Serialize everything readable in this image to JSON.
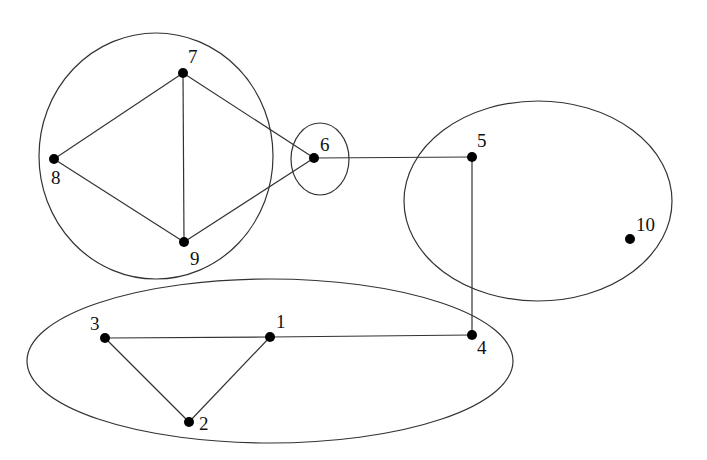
{
  "diagram": {
    "type": "graph",
    "clusters": [
      {
        "id": "A",
        "members": [
          "7",
          "8",
          "9"
        ],
        "shape": "circle",
        "cx": 156,
        "cy": 156,
        "rx": 117,
        "ry": 123
      },
      {
        "id": "B",
        "members": [
          "6"
        ],
        "shape": "ellipse",
        "cx": 320,
        "cy": 159,
        "rx": 29,
        "ry": 36
      },
      {
        "id": "C",
        "members": [
          "5",
          "10"
        ],
        "shape": "ellipse",
        "cx": 538,
        "cy": 201,
        "rx": 134,
        "ry": 100
      },
      {
        "id": "D",
        "members": [
          "1",
          "2",
          "3",
          "4"
        ],
        "shape": "ellipse",
        "cx": 270,
        "cy": 361,
        "rx": 243,
        "ry": 82
      }
    ],
    "nodes": [
      {
        "id": "1",
        "label": "1",
        "x": 270,
        "y": 337,
        "lx": 276,
        "ly": 328
      },
      {
        "id": "2",
        "label": "2",
        "x": 189,
        "y": 422,
        "lx": 199,
        "ly": 430
      },
      {
        "id": "3",
        "label": "3",
        "x": 105,
        "y": 338,
        "lx": 90,
        "ly": 330
      },
      {
        "id": "4",
        "label": "4",
        "x": 472,
        "y": 335,
        "lx": 477,
        "ly": 354
      },
      {
        "id": "5",
        "label": "5",
        "x": 472,
        "y": 157,
        "lx": 477,
        "ly": 147
      },
      {
        "id": "6",
        "label": "6",
        "x": 314,
        "y": 158,
        "lx": 320,
        "ly": 151
      },
      {
        "id": "7",
        "label": "7",
        "x": 183,
        "y": 73,
        "lx": 188,
        "ly": 63
      },
      {
        "id": "8",
        "label": "8",
        "x": 54,
        "y": 159,
        "lx": 51,
        "ly": 184
      },
      {
        "id": "9",
        "label": "9",
        "x": 184,
        "y": 242,
        "lx": 190,
        "ly": 265
      },
      {
        "id": "10",
        "label": "10",
        "x": 630,
        "y": 239,
        "lx": 636,
        "ly": 231
      }
    ],
    "edges": [
      {
        "from": "7",
        "to": "8"
      },
      {
        "from": "7",
        "to": "9"
      },
      {
        "from": "8",
        "to": "9"
      },
      {
        "from": "7",
        "to": "6"
      },
      {
        "from": "9",
        "to": "6"
      },
      {
        "from": "6",
        "to": "5"
      },
      {
        "from": "5",
        "to": "4"
      },
      {
        "from": "4",
        "to": "1"
      },
      {
        "from": "1",
        "to": "3"
      },
      {
        "from": "1",
        "to": "2"
      },
      {
        "from": "3",
        "to": "2"
      }
    ]
  }
}
